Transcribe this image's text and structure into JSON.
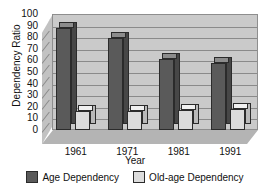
{
  "chart_data": {
    "type": "bar",
    "title": "",
    "xlabel": "Year",
    "ylabel": "Dependency Ratio",
    "categories": [
      "1961",
      "1971",
      "1981",
      "1991"
    ],
    "series": [
      {
        "name": "Age Dependency",
        "color": "#5a5a5a",
        "values": [
          88,
          79,
          61,
          58
        ]
      },
      {
        "name": "Old-age Dependency",
        "color": "#dcdcdc",
        "values": [
          16,
          16,
          17,
          18
        ]
      }
    ],
    "ylim": [
      0,
      100
    ],
    "ytick_step": 10,
    "yticks": [
      "0",
      "10",
      "20",
      "30",
      "40",
      "50",
      "60",
      "70",
      "80",
      "90",
      "100"
    ],
    "grid": true,
    "legend_position": "bottom",
    "style": "3d-clustered-column"
  },
  "axes": {
    "y_title": "Dependency Ratio",
    "x_title": "Year"
  },
  "legend": {
    "items": [
      {
        "label": "Age Dependency",
        "swatch": "dark"
      },
      {
        "label": "Old-age Dependency",
        "swatch": "light"
      }
    ]
  }
}
